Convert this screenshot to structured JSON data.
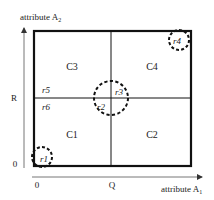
{
  "diagram": {
    "axes": {
      "x_label": "attribute A",
      "x_label_sub": "1",
      "y_label": "attribute A",
      "y_label_sub": "2",
      "x_ticks": [
        {
          "label": "0",
          "x": 37
        },
        {
          "label": "Q",
          "x": 112
        }
      ],
      "y_ticks": [
        {
          "label": "0",
          "y": 164
        },
        {
          "label": "R",
          "y": 100
        }
      ]
    },
    "cells": [
      {
        "id": "C1",
        "label": "C1"
      },
      {
        "id": "C2",
        "label": "C2"
      },
      {
        "id": "C3",
        "label": "C3"
      },
      {
        "id": "C4",
        "label": "C4"
      }
    ],
    "regions": [
      {
        "id": "r1",
        "label": "r1"
      },
      {
        "id": "r2",
        "label": "r2"
      },
      {
        "id": "r3",
        "label": "r3"
      },
      {
        "id": "r4",
        "label": "r4"
      },
      {
        "id": "r5",
        "label": "r5"
      },
      {
        "id": "r6",
        "label": "r6"
      }
    ],
    "colors": {
      "line": "#111111",
      "axis": "#555555",
      "text": "#222222"
    }
  }
}
